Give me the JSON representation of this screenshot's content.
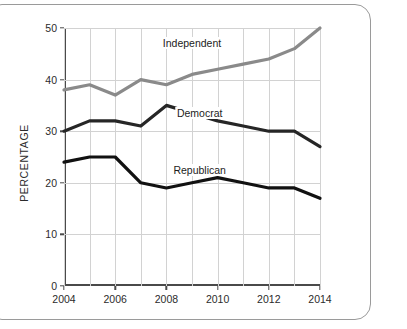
{
  "chart_data": {
    "type": "line",
    "title": "",
    "xlabel": "",
    "ylabel": "PERCENTAGE",
    "x": [
      2004,
      2005,
      2006,
      2007,
      2008,
      2009,
      2010,
      2011,
      2012,
      2013,
      2014
    ],
    "xlim": [
      2004,
      2014
    ],
    "ylim": [
      0,
      50
    ],
    "xticks": [
      "2004",
      "2006",
      "2008",
      "2010",
      "2012",
      "2014"
    ],
    "xtick_values": [
      2004,
      2006,
      2008,
      2010,
      2012,
      2014
    ],
    "yticks": [
      "0",
      "10",
      "20",
      "30",
      "40",
      "50"
    ],
    "ytick_values": [
      0,
      10,
      20,
      30,
      40,
      50
    ],
    "grid": true,
    "grid_x_step": 1,
    "grid_y_step": 10,
    "legend_position": "inline-labels",
    "series": [
      {
        "name": "Independent",
        "color": "#8a8a8a",
        "values": [
          38,
          39,
          37,
          40,
          39,
          41,
          42,
          43,
          44,
          46,
          50
        ],
        "label_x": 2009.0,
        "label_y": 47.0
      },
      {
        "name": "Democrat",
        "color": "#262626",
        "values": [
          30,
          32,
          32,
          31,
          35,
          33.5,
          32,
          31,
          30,
          30,
          27
        ],
        "label_x": 2009.3,
        "label_y": 33.5
      },
      {
        "name": "Republican",
        "color": "#111111",
        "values": [
          24,
          25,
          25,
          20,
          19,
          20,
          21,
          20,
          19,
          19,
          17
        ],
        "label_x": 2009.3,
        "label_y": 22.5
      }
    ]
  }
}
